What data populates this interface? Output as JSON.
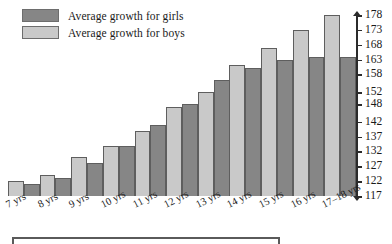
{
  "chart_data": {
    "type": "bar",
    "title": "",
    "subtitle": "",
    "xlabel": "",
    "ylabel": "",
    "grid": false,
    "legend_position": "top-left",
    "categories": [
      "7 yrs",
      "8 yrs",
      "9 yrs",
      "10 yrs",
      "11 yrs",
      "12 yrs",
      "13 yrs",
      "14 yrs",
      "15 yrs",
      "16 yrs",
      "17–18 yrs"
    ],
    "series": [
      {
        "name": "Average growth for boys",
        "color": "#c9c9c9",
        "values": [
          122,
          124,
          130,
          134,
          139,
          147,
          152,
          161,
          167,
          173,
          178
        ]
      },
      {
        "name": "Average growth for girls",
        "color": "#868686",
        "values": [
          121,
          123,
          128,
          134,
          141,
          148,
          156,
          160,
          163,
          164,
          164
        ]
      }
    ],
    "ylim": [
      117,
      178
    ],
    "ytick_labels": [
      "178",
      "173",
      "168",
      "163",
      "158",
      "152",
      "148",
      "142",
      "137",
      "132",
      "127",
      "122",
      "117"
    ],
    "ytick_values": [
      178,
      173,
      168,
      163,
      158,
      152,
      148,
      142,
      137,
      132,
      127,
      122,
      117
    ],
    "bar_order_within_group": [
      "boys",
      "girls"
    ]
  },
  "legend": {
    "items": [
      {
        "label": "Average growth for girls",
        "swatch": "#868686"
      },
      {
        "label": "Average growth for boys",
        "swatch": "#c9c9c9"
      }
    ]
  },
  "colors": {
    "girls": "#868686",
    "boys": "#c9c9c9",
    "axis": "#2b2b2b",
    "bar_outline": "#5e5e5e",
    "rule": "#5a5a5a",
    "background": "#ffffff"
  }
}
